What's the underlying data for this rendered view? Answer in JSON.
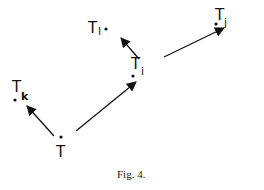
{
  "diagram": {
    "nodes": [
      {
        "id": "T",
        "label": "T",
        "sub": "",
        "x": 66,
        "y": 150
      },
      {
        "id": "Tk",
        "label": "T",
        "sub": "k",
        "x": 16,
        "y": 100
      },
      {
        "id": "Ti",
        "label": "T",
        "sub": "i",
        "x": 146,
        "y": 83
      },
      {
        "id": "Tl",
        "label": "T",
        "sub": "l",
        "x": 116,
        "y": 32
      },
      {
        "id": "Tj",
        "label": "T",
        "sub": "j",
        "x": 237,
        "y": 27
      }
    ],
    "edges": [
      {
        "from": "T",
        "to": "Tk"
      },
      {
        "from": "T",
        "to": "Ti"
      },
      {
        "from": "Ti",
        "to": "Tl"
      },
      {
        "from": "Ti",
        "to": "Tj"
      }
    ],
    "caption": "Fig. 4."
  }
}
